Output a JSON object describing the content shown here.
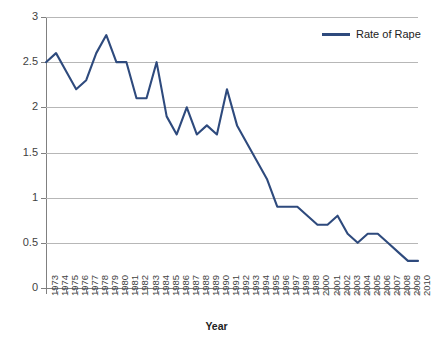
{
  "chart_data": {
    "type": "line",
    "title": "",
    "xlabel": "Year",
    "ylabel": "",
    "ylim": [
      0,
      3
    ],
    "yticks": [
      0,
      0.5,
      1,
      1.5,
      2,
      2.5,
      3
    ],
    "ytick_labels": [
      "0",
      "0.5",
      "1",
      "1.5",
      "2",
      "2.5",
      "3"
    ],
    "grid": true,
    "legend_position": "top-right",
    "legend": [
      "Rate of Rape"
    ],
    "series_color": "#2E4A7D",
    "categories": [
      "1973",
      "1974",
      "1975",
      "1976",
      "1977",
      "1978",
      "1979",
      "1980",
      "1981",
      "1982",
      "1983",
      "1984",
      "1985",
      "1986",
      "1987",
      "1988",
      "1989",
      "1990",
      "1991",
      "1992",
      "1993",
      "1994",
      "1995",
      "1996",
      "1997",
      "1998",
      "1988",
      "2000",
      "2001",
      "2002",
      "2003",
      "2004",
      "2005",
      "2006",
      "2007",
      "2008",
      "2009",
      "2010"
    ],
    "series": [
      {
        "name": "Rate of Rape",
        "values": [
          2.5,
          2.6,
          2.4,
          2.2,
          2.3,
          2.6,
          2.8,
          2.5,
          2.5,
          2.1,
          2.1,
          2.5,
          1.9,
          1.7,
          2.0,
          1.7,
          1.8,
          1.7,
          2.2,
          1.8,
          1.6,
          1.4,
          1.2,
          0.9,
          0.9,
          0.9,
          0.8,
          0.7,
          0.7,
          0.8,
          0.6,
          0.5,
          0.6,
          0.6,
          0.5,
          0.4,
          0.3,
          0.3
        ]
      }
    ]
  },
  "axis": {
    "x_title": "Year"
  }
}
